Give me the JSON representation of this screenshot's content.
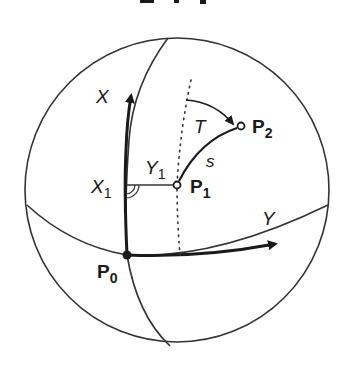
{
  "figure": {
    "title_fragment": "...ing ...",
    "colors": {
      "ink": "#1a1a1a",
      "thin_line": "#333333",
      "background": "#ffffff"
    },
    "sphere": {
      "center": [
        177,
        190
      ],
      "radius": 152
    },
    "labels": {
      "x_axis": "X",
      "y_axis": "Y",
      "x1": "X",
      "x1_sub": "1",
      "y1": "Y",
      "y1_sub": "1",
      "p0": "P",
      "p0_sub": "0",
      "p1": "P",
      "p1_sub": "1",
      "p2": "P",
      "p2_sub": "2",
      "bearing": "T",
      "distance": "s"
    },
    "points": {
      "P0": [
        127,
        255
      ],
      "P1": [
        177,
        185
      ],
      "P2": [
        241,
        126
      ]
    }
  }
}
